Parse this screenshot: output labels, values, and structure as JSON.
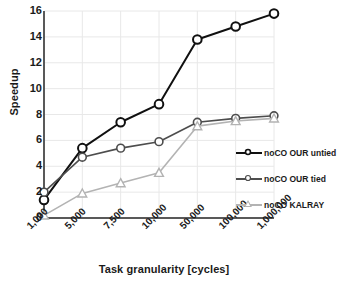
{
  "chart_data": {
    "type": "line",
    "title": "",
    "xlabel": "Task granularity [cycles]",
    "ylabel": "Speedup",
    "categories": [
      "1,000",
      "5,000",
      "7,500",
      "10,000",
      "50,000",
      "100,000",
      "1,000,000"
    ],
    "ylim": [
      0,
      16
    ],
    "yticks": [
      0,
      2,
      4,
      6,
      8,
      10,
      12,
      14,
      16
    ],
    "ytick_labels": [
      "0",
      "2",
      "4",
      "6",
      "8",
      "10",
      "12",
      "14",
      "16"
    ],
    "grid": true,
    "grid_axis": "both",
    "legend_position": "right",
    "series": [
      {
        "name": "noCO OUR untied",
        "color": "#101010",
        "marker": "circle",
        "values": [
          1.4,
          5.4,
          7.4,
          8.8,
          13.8,
          14.8,
          15.8
        ]
      },
      {
        "name": "noCO OUR tied",
        "color": "#4d4d4d",
        "marker": "circle",
        "values": [
          2.0,
          4.7,
          5.4,
          5.9,
          7.4,
          7.7,
          7.9
        ]
      },
      {
        "name": "noCO KALRAY",
        "color": "#b3b3b3",
        "marker": "triangle",
        "values": [
          0.2,
          1.9,
          2.7,
          3.5,
          7.1,
          7.5,
          7.7
        ]
      }
    ]
  },
  "legend": {
    "items": [
      {
        "label": "noCO OUR untied"
      },
      {
        "label": "noCO OUR tied"
      },
      {
        "label": "noCO KALRAY"
      }
    ]
  },
  "colors": {
    "untied": "#101010",
    "tied": "#4d4d4d",
    "kalray": "#b3b3b3",
    "axis": "#595959",
    "grid": "#e8e8e8",
    "text": "#1a1a1a",
    "background": "#ffffff"
  }
}
